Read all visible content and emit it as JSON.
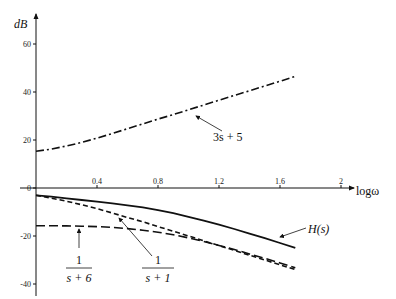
{
  "chart_data": {
    "type": "line",
    "title": "",
    "xlabel": "logω",
    "ylabel": "dB",
    "xlim": [
      0,
      2.15
    ],
    "ylim": [
      -40,
      70
    ],
    "xticks": [
      0.4,
      0.8,
      1.2,
      1.6,
      2
    ],
    "xtick_labels": [
      "0.4",
      "0.8",
      "1.2",
      "1.6",
      "2"
    ],
    "yticks": [
      60,
      40,
      20,
      0,
      -20,
      -40
    ],
    "ytick_labels": [
      "60",
      "40",
      "20",
      "0",
      "-20",
      "-40"
    ],
    "grid": false,
    "legend": "inline annotations",
    "x": [
      0,
      0.1,
      0.2,
      0.3,
      0.4,
      0.5,
      0.6,
      0.7,
      0.8,
      0.9,
      1.0,
      1.1,
      1.2,
      1.3,
      1.4,
      1.5,
      1.6,
      1.7
    ],
    "series": [
      {
        "name": "3s + 5",
        "style": "dash-dot",
        "values": [
          15.3,
          16.2,
          17.5,
          19.0,
          20.8,
          22.7,
          24.7,
          26.7,
          28.7,
          30.6,
          32.6,
          34.6,
          36.6,
          38.6,
          40.5,
          42.5,
          44.5,
          46.5
        ]
      },
      {
        "name": "H(s)",
        "style": "solid",
        "values": [
          -3.1,
          -3.6,
          -4.3,
          -5.0,
          -5.7,
          -6.4,
          -7.2,
          -8.1,
          -9.2,
          -10.5,
          -12.0,
          -13.6,
          -15.3,
          -17.1,
          -19.0,
          -20.9,
          -22.9,
          -24.9
        ]
      },
      {
        "name": "1/(s+1)",
        "style": "dashed",
        "values": [
          -3.0,
          -4.2,
          -5.5,
          -7.0,
          -8.6,
          -10.4,
          -12.3,
          -14.1,
          -16.1,
          -18.0,
          -20.0,
          -22.0,
          -24.0,
          -26.0,
          -28.0,
          -30.0,
          -32.0,
          -34.0
        ]
      },
      {
        "name": "1/(s+6)",
        "style": "long-dash",
        "values": [
          -15.7,
          -15.7,
          -15.8,
          -15.9,
          -16.1,
          -16.4,
          -16.9,
          -17.6,
          -18.4,
          -19.5,
          -20.8,
          -22.3,
          -23.9,
          -25.6,
          -27.5,
          -29.3,
          -31.2,
          -33.2
        ]
      }
    ],
    "annotations": [
      "3s + 5",
      "H(s)",
      "1/(s+1)",
      "1/(s+6)"
    ]
  },
  "labels": {
    "ylabel": "dB",
    "xlabel": "logω",
    "ann_3s5": "3s + 5",
    "ann_H": "H(s)",
    "ann_s1_num": "1",
    "ann_s1_den": "s + 1",
    "ann_s6_num": "1",
    "ann_s6_den": "s + 6"
  }
}
